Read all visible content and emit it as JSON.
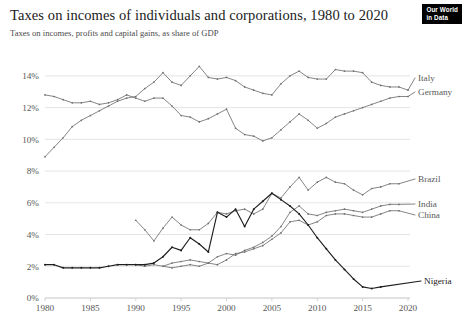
{
  "header": {
    "title": "Taxes on incomes of individuals and corporations, 1980 to 2020",
    "subtitle": "Taxes on incomes, profits and capital gains, as share of GDP"
  },
  "logo": {
    "line1": "Our World",
    "line2": "in Data"
  },
  "chart_data": {
    "type": "line",
    "title": "Taxes on incomes of individuals and corporations, 1980 to 2020",
    "subtitle": "Taxes on incomes, profits and capital gains, as share of GDP",
    "xlabel": "",
    "ylabel": "",
    "xlim": [
      1980,
      2020
    ],
    "ylim": [
      0,
      15
    ],
    "grid": true,
    "legend_position": "right-end-of-line",
    "x_ticks": [
      1980,
      1985,
      1990,
      1995,
      2000,
      2005,
      2010,
      2015,
      2020
    ],
    "x_tick_labels": [
      "1980",
      "1985",
      "1990",
      "1995",
      "2000",
      "2005",
      "2010",
      "2015",
      "2020"
    ],
    "y_ticks": [
      0,
      2,
      4,
      6,
      8,
      10,
      12,
      14
    ],
    "y_tick_labels": [
      "0%",
      "2%",
      "4%",
      "6%",
      "8%",
      "10%",
      "12%",
      "14%"
    ],
    "series": [
      {
        "name": "Italy",
        "label": "Italy",
        "emphasis": false,
        "label_value": 13.1,
        "x": [
          1980,
          1981,
          1982,
          1983,
          1984,
          1985,
          1986,
          1987,
          1988,
          1989,
          1990,
          1991,
          1992,
          1993,
          1994,
          1995,
          1996,
          1997,
          1998,
          1999,
          2000,
          2001,
          2002,
          2003,
          2004,
          2005,
          2006,
          2007,
          2008,
          2009,
          2010,
          2011,
          2012,
          2013,
          2014,
          2015,
          2016,
          2017,
          2018,
          2019,
          2020
        ],
        "values": [
          8.9,
          9.5,
          10.1,
          10.8,
          11.2,
          11.5,
          11.8,
          12.1,
          12.4,
          12.6,
          12.7,
          13.2,
          13.6,
          14.2,
          13.6,
          13.4,
          14.0,
          14.6,
          13.9,
          13.8,
          13.9,
          13.7,
          13.3,
          13.1,
          12.9,
          12.8,
          13.5,
          14.0,
          14.3,
          13.9,
          13.8,
          13.8,
          14.4,
          14.3,
          14.3,
          14.2,
          13.6,
          13.4,
          13.3,
          13.3,
          13.1
        ]
      },
      {
        "name": "Germany",
        "label": "Germany",
        "emphasis": false,
        "label_value": 12.7,
        "x": [
          1980,
          1981,
          1982,
          1983,
          1984,
          1985,
          1986,
          1987,
          1988,
          1989,
          1990,
          1991,
          1992,
          1993,
          1994,
          1995,
          1996,
          1997,
          1998,
          1999,
          2000,
          2001,
          2002,
          2003,
          2004,
          2005,
          2006,
          2007,
          2008,
          2009,
          2010,
          2011,
          2012,
          2013,
          2014,
          2015,
          2016,
          2017,
          2018,
          2019,
          2020
        ],
        "values": [
          12.8,
          12.7,
          12.5,
          12.3,
          12.3,
          12.4,
          12.2,
          12.3,
          12.5,
          12.8,
          12.6,
          12.4,
          12.6,
          12.6,
          12.1,
          11.5,
          11.4,
          11.1,
          11.3,
          11.6,
          11.9,
          10.7,
          10.3,
          10.2,
          9.9,
          10.1,
          10.6,
          11.1,
          11.6,
          11.2,
          10.7,
          11.0,
          11.4,
          11.6,
          11.8,
          12.0,
          12.2,
          12.4,
          12.6,
          12.7,
          12.7
        ]
      },
      {
        "name": "Brazil",
        "label": "Brazil",
        "emphasis": false,
        "label_value": 7.2,
        "x": [
          1990,
          1991,
          1992,
          1993,
          1994,
          1995,
          1996,
          1997,
          1998,
          1999,
          2000,
          2001,
          2002,
          2003,
          2004,
          2005,
          2006,
          2007,
          2008,
          2009,
          2010,
          2011,
          2012,
          2013,
          2014,
          2015,
          2016,
          2017,
          2018,
          2019
        ],
        "values": [
          4.9,
          4.3,
          3.6,
          4.4,
          5.1,
          4.6,
          4.3,
          4.3,
          4.7,
          5.4,
          5.3,
          5.5,
          5.6,
          5.3,
          5.6,
          6.6,
          6.3,
          7.0,
          7.6,
          6.8,
          7.3,
          7.6,
          7.3,
          7.2,
          6.8,
          6.5,
          6.9,
          7.0,
          7.2,
          7.2
        ]
      },
      {
        "name": "India",
        "label": "India",
        "emphasis": false,
        "label_value": 5.9,
        "x": [
          1990,
          1991,
          1992,
          1993,
          1994,
          1995,
          1996,
          1997,
          1998,
          1999,
          2000,
          2001,
          2002,
          2003,
          2004,
          2005,
          2006,
          2007,
          2008,
          2009,
          2010,
          2011,
          2012,
          2013,
          2014,
          2015,
          2016,
          2017,
          2018,
          2019
        ],
        "values": [
          2.1,
          2.0,
          2.1,
          2.0,
          2.2,
          2.3,
          2.4,
          2.3,
          2.2,
          2.6,
          2.8,
          2.7,
          3.0,
          3.2,
          3.5,
          3.9,
          4.5,
          5.4,
          5.8,
          5.3,
          5.2,
          5.4,
          5.5,
          5.6,
          5.5,
          5.4,
          5.6,
          5.8,
          5.9,
          5.9
        ]
      },
      {
        "name": "China",
        "label": "China",
        "emphasis": false,
        "label_value": 5.5,
        "x": [
          1993,
          1994,
          1995,
          1996,
          1997,
          1998,
          1999,
          2000,
          2001,
          2002,
          2003,
          2004,
          2005,
          2006,
          2007,
          2008,
          2009,
          2010,
          2011,
          2012,
          2013,
          2014,
          2015,
          2016,
          2017,
          2018,
          2019
        ],
        "values": [
          2.0,
          1.9,
          2.0,
          2.1,
          2.0,
          2.2,
          2.1,
          2.4,
          2.8,
          2.9,
          3.1,
          3.3,
          3.7,
          4.1,
          4.8,
          4.9,
          4.6,
          4.8,
          5.2,
          5.3,
          5.3,
          5.2,
          5.1,
          5.1,
          5.3,
          5.5,
          5.5
        ]
      },
      {
        "name": "Nigeria",
        "label": "Nigeria",
        "emphasis": true,
        "label_value": 0.6,
        "x": [
          1980,
          1981,
          1982,
          1983,
          1984,
          1985,
          1986,
          1987,
          1988,
          1989,
          1990,
          1991,
          1992,
          1993,
          1994,
          1995,
          1996,
          1997,
          1998,
          1999,
          2000,
          2001,
          2002,
          2003,
          2004,
          2005,
          2006,
          2007,
          2008,
          2009,
          2010,
          2011,
          2012,
          2013,
          2014,
          2015,
          2016,
          2017
        ],
        "values": [
          2.1,
          2.1,
          1.9,
          1.9,
          1.9,
          1.9,
          1.9,
          2.0,
          2.1,
          2.1,
          2.1,
          2.1,
          2.2,
          2.6,
          3.2,
          3.0,
          3.8,
          3.4,
          2.9,
          5.4,
          5.1,
          5.6,
          4.5,
          5.6,
          6.1,
          6.6,
          6.2,
          5.8,
          5.3,
          4.6,
          3.8,
          3.1,
          2.4,
          1.8,
          1.2,
          0.7,
          0.6,
          0.7
        ]
      }
    ]
  }
}
